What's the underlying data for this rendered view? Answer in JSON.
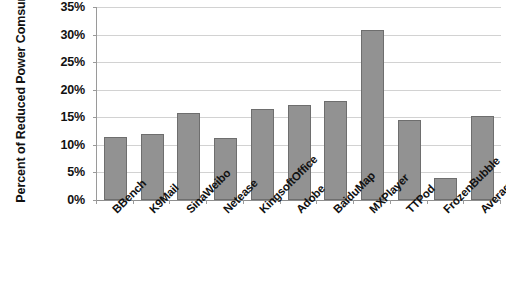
{
  "chart_data": {
    "type": "bar",
    "title": "",
    "xlabel": "",
    "ylabel": "Percent of Reduced Power Comsumption",
    "ylim": [
      0,
      35
    ],
    "ytick_labels": [
      "35%",
      "30%",
      "25%",
      "20%",
      "15%",
      "10%",
      "5%",
      "0%"
    ],
    "ytick_values": [
      35,
      30,
      25,
      20,
      15,
      10,
      5,
      0
    ],
    "grid": true,
    "legend": "none",
    "bar_color": "#929292",
    "bar_border_color": "#6e6e6e",
    "gridline_color": "#d2d2d2",
    "axis_color": "#9a9a9a",
    "categories": [
      "BBench",
      "K9Mail",
      "SinaWeibo",
      "Netease",
      "KingsoftOffice",
      "Adobe",
      "BaiduMap",
      "MXPlayer",
      "TTPod",
      "FrozenBubble",
      "Average"
    ],
    "values": [
      11.5,
      11.9,
      15.7,
      11.2,
      16.5,
      17.3,
      18.0,
      30.8,
      14.5,
      4.0,
      15.3
    ]
  }
}
